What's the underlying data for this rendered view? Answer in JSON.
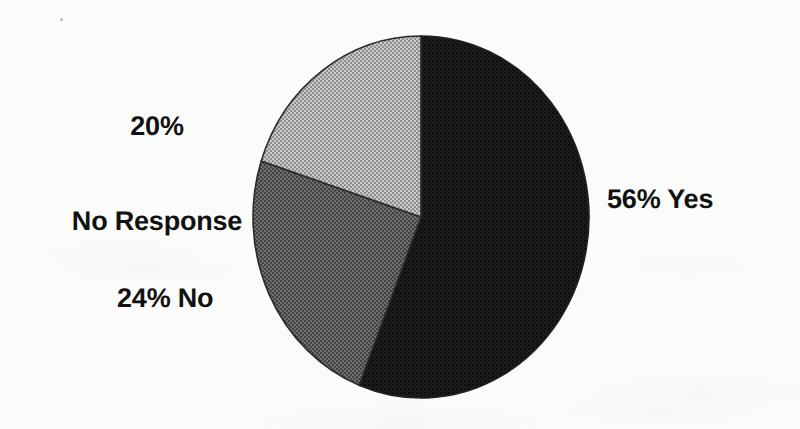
{
  "chart_data": {
    "type": "pie",
    "title": "",
    "xlabel": "",
    "ylabel": "",
    "categories": [
      "Yes",
      "No",
      "No Response"
    ],
    "values": [
      56,
      24,
      20
    ],
    "value_unit": "%",
    "total": 100,
    "legend_position": "none",
    "grid": false,
    "labels_inline": true,
    "start_angle_deg": 0,
    "direction": "clockwise",
    "slices": [
      {
        "name": "Yes",
        "percent": 56,
        "label": "56% Yes",
        "color": "#1a1a1a",
        "fill_style": "solid-dark-halftone",
        "start_angle_deg": 0,
        "end_angle_deg": 201.6
      },
      {
        "name": "No",
        "percent": 24,
        "label": "24% No",
        "color": "#5a5a5a",
        "fill_style": "medium-gray-halftone",
        "start_angle_deg": 201.6,
        "end_angle_deg": 288.0
      },
      {
        "name": "No Response",
        "percent": 20,
        "label": "20% No Response",
        "color": "#b0b0b0",
        "fill_style": "light-gray-halftone",
        "start_angle_deg": 288.0,
        "end_angle_deg": 360.0
      }
    ]
  },
  "labels": {
    "no_response_percent": "20%",
    "no_response_name": "No Response",
    "yes": "56% Yes",
    "no": "24% No"
  },
  "colors": {
    "background": "#fbfbfa",
    "text": "#111111",
    "slice_yes": "#1a1a1a",
    "slice_no": "#5a5a5a",
    "slice_no_response": "#b0b0b0",
    "outline": "#2b2b2b"
  },
  "geometry": {
    "center_x": 421,
    "center_y": 217,
    "radius_x": 168,
    "radius_y": 181
  }
}
